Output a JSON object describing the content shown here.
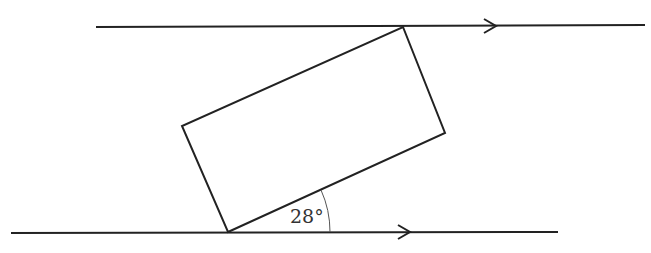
{
  "diagram": {
    "type": "geometry",
    "angle_label": "28°",
    "stroke_color": "#222222",
    "parallel_lines": [
      {
        "name": "top-line",
        "x1": 96,
        "y1": 27,
        "x2": 645,
        "y2": 25,
        "arrow_x": 496
      },
      {
        "name": "bottom-line",
        "x1": 11,
        "y1": 233,
        "x2": 558,
        "y2": 232,
        "arrow_x": 404
      }
    ],
    "rectangle_vertices": [
      [
        228,
        232
      ],
      [
        445,
        133
      ],
      [
        403,
        27
      ],
      [
        182,
        126
      ]
    ]
  }
}
